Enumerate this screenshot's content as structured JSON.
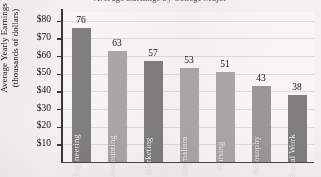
{
  "chart_data": {
    "type": "bar",
    "title": "Average Earnings by College Major",
    "xlabel": "",
    "ylabel": "Average Yearly Earnings (thousands of dollars)",
    "ylabel_line1": "Average Yearly Earnings",
    "ylabel_line2": "(thousands of dollars)",
    "categories": [
      "Engineering",
      "Accounting",
      "Marketing",
      "Journalism",
      "Nursing",
      "Philosophy",
      "Social Work"
    ],
    "values": [
      76,
      63,
      57,
      53,
      51,
      43,
      38
    ],
    "value_labels": [
      "76",
      "63",
      "57",
      "53",
      "51",
      "43",
      "38"
    ],
    "bar_colors": [
      "#807f7d",
      "#aaa8a5",
      "#807f7d",
      "#aaa8a5",
      "#aaa8a5",
      "#9a9895",
      "#807f7d"
    ],
    "ylim": [
      0,
      85
    ],
    "yticks": [
      10,
      20,
      30,
      40,
      50,
      60,
      70,
      80
    ],
    "ytick_labels": [
      "$10",
      "$20",
      "$30",
      "$40",
      "$50",
      "$60",
      "$70",
      "$80"
    ],
    "grid": true,
    "legend": false,
    "legend_position": "none",
    "xtick_labels": [],
    "note": "Category names printed vertically inside each bar; value printed above each bar."
  },
  "figure": {
    "background_color": "#f4f2ee",
    "plot_background_color": "#f7f6f2",
    "axis_color": "#3a3734",
    "gridline_color": "#dedcd6",
    "text_color": "#15120f"
  }
}
